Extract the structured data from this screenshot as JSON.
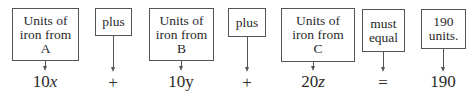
{
  "diagram": {
    "type": "equation-translation",
    "boxes": [
      {
        "id": "iron-a",
        "text": "Units of iron from A",
        "term": "10x"
      },
      {
        "id": "plus-1",
        "text": "plus",
        "term": "+"
      },
      {
        "id": "iron-b",
        "text": "Units of iron from B",
        "term": "10y"
      },
      {
        "id": "plus-2",
        "text": "plus",
        "term": "+"
      },
      {
        "id": "iron-c",
        "text": "Units of iron from C",
        "term": "20z"
      },
      {
        "id": "equal",
        "text": "must equal",
        "term": "="
      },
      {
        "id": "total",
        "text": "190 units.",
        "term": "190"
      }
    ],
    "lines": {
      "iron_a": [
        "Units of",
        "iron from",
        "A"
      ],
      "plus_1": [
        "plus"
      ],
      "iron_b": [
        "Units of",
        "iron from",
        "B"
      ],
      "plus_2": [
        "plus"
      ],
      "iron_c": [
        "Units of",
        "iron from",
        "C"
      ],
      "equal": [
        "must",
        "equal"
      ],
      "total": [
        "190",
        "units."
      ]
    },
    "terms": {
      "a_coef": "10",
      "a_var": "x",
      "plus_1": "+",
      "b_coef": "10",
      "b_var": "y",
      "plus_2": "+",
      "c_coef": "20",
      "c_var": "z",
      "equal": "=",
      "total": "190"
    }
  }
}
